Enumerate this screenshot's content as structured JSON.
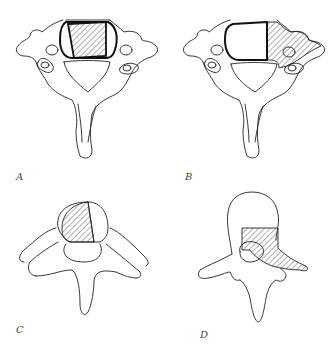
{
  "figure": {
    "panels": [
      {
        "id": "A",
        "label": "A",
        "view": "cervical-vertebra-superior",
        "hatched_region": "vertebral-body-central"
      },
      {
        "id": "B",
        "label": "B",
        "view": "cervical-vertebra-superior",
        "hatched_region": "vertebral-body-right-and-transverse-process"
      },
      {
        "id": "C",
        "label": "C",
        "view": "thoracic-vertebra-superior",
        "hatched_region": "vertebral-body-left"
      },
      {
        "id": "D",
        "label": "D",
        "view": "lumbar-vertebra-posterior",
        "hatched_region": "right-pedicle-and-transverse-process"
      }
    ],
    "colors": {
      "line": "#222222",
      "background": "#ffffff",
      "label": "#444444"
    }
  }
}
